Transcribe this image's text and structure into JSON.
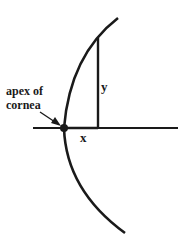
{
  "diagram": {
    "type": "geometric-figure",
    "labels": {
      "apex_line1": "apex of",
      "apex_line2": "cornea",
      "y": "y",
      "x": "x"
    },
    "colors": {
      "stroke": "#1a1a1a",
      "background": "#ffffff"
    }
  }
}
